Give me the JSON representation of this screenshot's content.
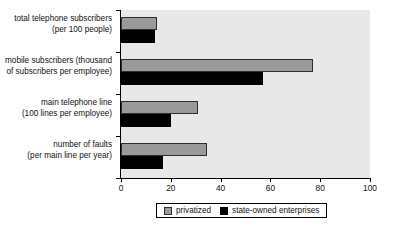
{
  "chart_data": {
    "type": "bar",
    "orientation": "horizontal",
    "title": "",
    "xlabel": "",
    "ylabel": "",
    "xlim": [
      0,
      100
    ],
    "xticks": [
      0,
      20,
      40,
      60,
      80,
      100
    ],
    "grid": false,
    "legend_position": "bottom-center",
    "categories": [
      {
        "line1": "total telephone subscribers",
        "line2": "(per 100 people)"
      },
      {
        "line1": "mobile subscribers (thousand",
        "line2": "of subscribers per employee)"
      },
      {
        "line1": "main telephone line",
        "line2": "(100 lines per employee)"
      },
      {
        "line1": "number of faults",
        "line2": "(per main line per year)"
      }
    ],
    "series": [
      {
        "name": "privatized",
        "color": "#9a9a9a",
        "values": [
          14.5,
          77,
          31,
          34.5
        ]
      },
      {
        "name": "state-owned enterprises",
        "color": "#000000",
        "values": [
          13.7,
          57,
          20,
          17
        ]
      }
    ]
  },
  "legend": {
    "items": [
      {
        "label": "privatized"
      },
      {
        "label": "state-owned enterprises"
      }
    ]
  },
  "axis": {
    "tick_labels": [
      "0",
      "20",
      "40",
      "60",
      "80",
      "100"
    ]
  }
}
